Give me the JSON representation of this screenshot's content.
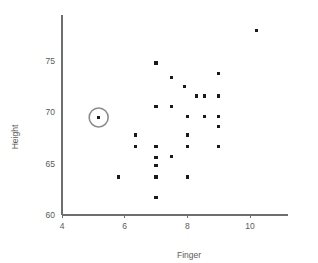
{
  "chart_data": {
    "type": "scatter",
    "title": "",
    "xlabel": "Finger",
    "ylabel": "Height",
    "xlim": [
      4,
      11.2
    ],
    "ylim": [
      60,
      79.5
    ],
    "xticks": [
      4,
      6,
      8,
      10
    ],
    "xtick_labels": [
      "4",
      "6",
      "8",
      "10"
    ],
    "yticks": [
      60,
      65,
      70,
      75
    ],
    "ytick_labels": [
      "60",
      "65",
      "70",
      "75"
    ],
    "grid": false,
    "legend": null,
    "marker": "square",
    "marker_color": "#1a1a1a",
    "axis_color": "#6e6e6e",
    "highlight_color": "#8c8c8c",
    "points": [
      {
        "x": 5.17,
        "y": 69.5,
        "highlighted": true
      },
      {
        "x": 5.8,
        "y": 63.7,
        "highlighted": false
      },
      {
        "x": 6.35,
        "y": 67.8,
        "highlighted": false
      },
      {
        "x": 6.35,
        "y": 66.7,
        "highlighted": false
      },
      {
        "x": 7.0,
        "y": 74.8,
        "highlighted": false
      },
      {
        "x": 7.0,
        "y": 70.6,
        "highlighted": false
      },
      {
        "x": 7.0,
        "y": 66.7,
        "highlighted": false
      },
      {
        "x": 7.0,
        "y": 65.6,
        "highlighted": false
      },
      {
        "x": 7.0,
        "y": 64.8,
        "highlighted": false
      },
      {
        "x": 7.0,
        "y": 63.7,
        "highlighted": false
      },
      {
        "x": 7.0,
        "y": 61.7,
        "highlighted": false
      },
      {
        "x": 7.5,
        "y": 70.6,
        "highlighted": false
      },
      {
        "x": 7.5,
        "y": 73.4,
        "highlighted": false
      },
      {
        "x": 7.5,
        "y": 65.7,
        "highlighted": false
      },
      {
        "x": 7.9,
        "y": 72.5,
        "highlighted": false
      },
      {
        "x": 8.0,
        "y": 69.6,
        "highlighted": false
      },
      {
        "x": 8.0,
        "y": 67.8,
        "highlighted": false
      },
      {
        "x": 8.0,
        "y": 66.7,
        "highlighted": false
      },
      {
        "x": 8.0,
        "y": 63.7,
        "highlighted": false
      },
      {
        "x": 8.3,
        "y": 71.6,
        "highlighted": false
      },
      {
        "x": 8.55,
        "y": 71.6,
        "highlighted": false
      },
      {
        "x": 8.55,
        "y": 69.6,
        "highlighted": false
      },
      {
        "x": 9.0,
        "y": 73.8,
        "highlighted": false
      },
      {
        "x": 9.0,
        "y": 71.6,
        "highlighted": false
      },
      {
        "x": 9.0,
        "y": 69.6,
        "highlighted": false
      },
      {
        "x": 9.0,
        "y": 68.6,
        "highlighted": false
      },
      {
        "x": 9.0,
        "y": 66.7,
        "highlighted": false
      },
      {
        "x": 10.2,
        "y": 78.0,
        "highlighted": false
      }
    ]
  }
}
